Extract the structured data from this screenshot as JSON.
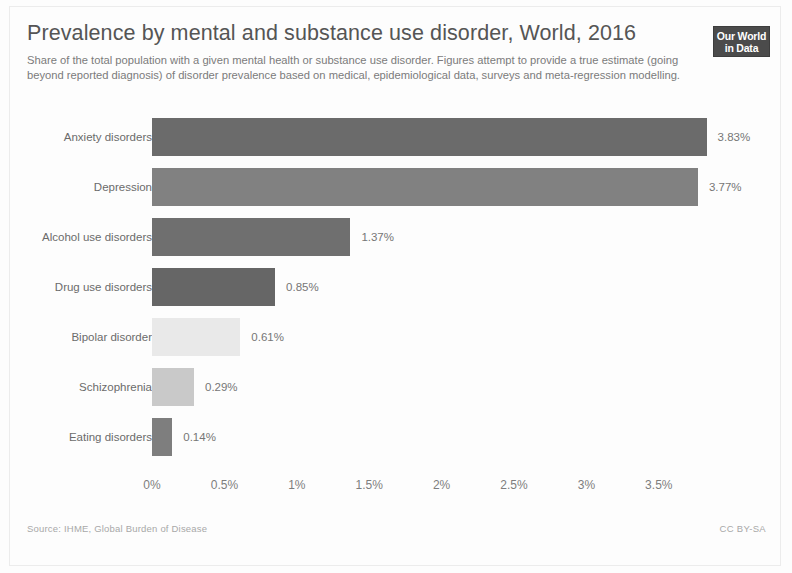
{
  "header": {
    "title": "Prevalence by mental and substance use disorder, World, 2016",
    "subtitle": "Share of the total population with a given mental health or substance use disorder. Figures attempt to provide a true estimate (going beyond reported diagnosis) of disorder prevalence based on medical, epidemiological data, surveys and meta-regression modelling.",
    "logo_line1": "Our World",
    "logo_line2": "in Data"
  },
  "footer": {
    "source": "Source: IHME, Global Burden of Disease",
    "license": "CC BY-SA"
  },
  "chart_data": {
    "type": "bar",
    "orientation": "horizontal",
    "title": "Prevalence by mental and substance use disorder, World, 2016",
    "subtitle": "Share of the total population with a given mental health or substance use disorder. Figures attempt to provide a true estimate (going beyond reported diagnosis) of disorder prevalence based on medical, epidemiological data, surveys and meta-regression modelling.",
    "xlabel": "",
    "ylabel": "",
    "xlim": [
      0,
      3.95
    ],
    "grid": false,
    "legend": "none",
    "categories": [
      "Anxiety disorders",
      "Depression",
      "Alcohol use disorders",
      "Drug use disorders",
      "Bipolar disorder",
      "Schizophrenia",
      "Eating disorders"
    ],
    "values": [
      3.83,
      3.77,
      1.37,
      0.85,
      0.61,
      0.29,
      0.14
    ],
    "value_labels": [
      "3.83%",
      "3.77%",
      "1.37%",
      "0.85%",
      "0.61%",
      "0.29%",
      "0.14%"
    ],
    "bar_colors": [
      "#6b6b6b",
      "#818181",
      "#6f6f6f",
      "#666666",
      "#e9e9e9",
      "#c9c9c9",
      "#7e7e7e"
    ],
    "xticks": [
      0,
      0.5,
      1,
      1.5,
      2,
      2.5,
      3,
      3.5
    ],
    "xtick_labels": [
      "0%",
      "0.5%",
      "1%",
      "1.5%",
      "2%",
      "2.5%",
      "3%",
      "3.5%"
    ]
  },
  "scale": {
    "origin_px": 152,
    "px_per_percent": 144.8
  }
}
